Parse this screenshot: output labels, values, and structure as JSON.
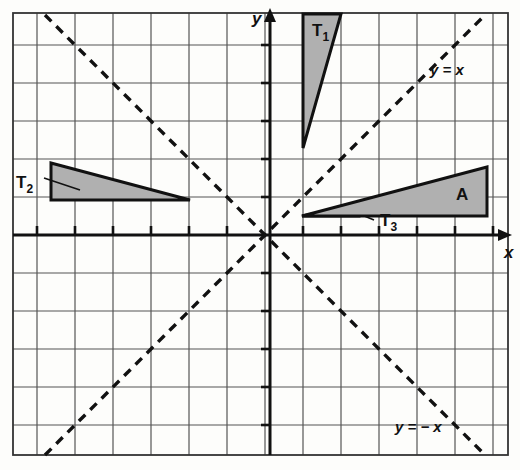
{
  "figure": {
    "type": "coordinate-geometry-diagram",
    "background_color": "#fdfdfb",
    "grid": {
      "spacing_px": 38,
      "origin_px": {
        "x": 265,
        "y": 235
      },
      "left_px": 13,
      "right_px": 508,
      "top_px": 13,
      "bottom_px": 455,
      "columns": 13,
      "rows": 12,
      "x_range": [
        -6.6,
        6.4
      ],
      "y_range": [
        -5.8,
        5.8
      ],
      "line_color": "#555555",
      "line_width": 1.2
    },
    "axes": {
      "color": "#111111",
      "width": 3,
      "x_axis": {
        "label": "x",
        "label_x": 504,
        "label_y": 258
      },
      "y_axis": {
        "label": "y",
        "label_x": 252,
        "label_y": 24
      },
      "tick_length": 9
    },
    "mirror_lines": [
      {
        "name": "line-y-equals-x",
        "label": "y = x",
        "label_x": 430,
        "label_y": 75,
        "dash": "9 7",
        "color": "#111111",
        "width": 3.4,
        "from": {
          "x": 45,
          "y": 455
        },
        "to": {
          "x": 485,
          "y": 15
        }
      },
      {
        "name": "line-y-equals-minus-x",
        "label": "y = − x",
        "label_x": 395,
        "label_y": 432,
        "dash": "9 7",
        "color": "#111111",
        "width": 3.4,
        "from": {
          "x": 45,
          "y": 15
        },
        "to": {
          "x": 485,
          "y": 455
        }
      }
    ],
    "shapes": [
      {
        "name": "triangle-T1",
        "label": "T₁",
        "label_text": "T",
        "label_sub": "1",
        "label_x": 312,
        "label_y": 36,
        "points": "303,14 341,14 303,148",
        "fill": "#b0b0b0",
        "stroke": "#111111",
        "stroke_width": 3
      },
      {
        "name": "triangle-T2",
        "label": "T₂",
        "label_text": "T",
        "label_sub": "2",
        "label_x": 16,
        "label_y": 188,
        "points": "51,163 51,200 190,200",
        "fill": "#b0b0b0",
        "stroke": "#111111",
        "stroke_width": 3,
        "leader": {
          "x1": 44,
          "y1": 178,
          "x2": 80,
          "y2": 190
        }
      },
      {
        "name": "triangle-T3",
        "label": "T₃",
        "label_text": "T",
        "label_sub": "3",
        "label_x": 380,
        "label_y": 226,
        "points": "302,216 359,205 359,216",
        "fill": "#b0b0b0",
        "stroke": "#111111",
        "stroke_width": 3,
        "leader": {
          "x1": 374,
          "y1": 220,
          "x2": 345,
          "y2": 208
        }
      },
      {
        "name": "triangle-A",
        "label": "A",
        "label_x": 456,
        "label_y": 200,
        "points": "302,216 487,167 487,216",
        "fill": "#b0b0b0",
        "stroke": "#111111",
        "stroke_width": 3
      }
    ]
  }
}
